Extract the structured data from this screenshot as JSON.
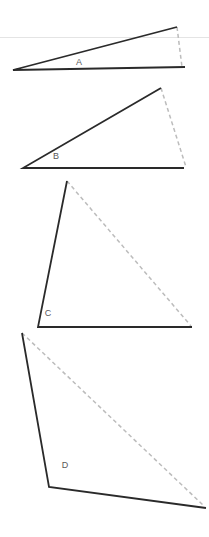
{
  "figure": {
    "background_color": "#ffffff",
    "width": 209,
    "height": 537,
    "solid_stroke_color": "#2a2a2a",
    "dashed_stroke_color": "#bcbcbc",
    "rule_color": "#e2e2e2",
    "label_color": "#5a5a5a",
    "solid_stroke_width": 1.8,
    "dashed_stroke_width": 1.5,
    "dash_pattern": "4 3"
  },
  "guides": [
    {
      "name": "top-horizontal-rule",
      "x1": 0,
      "y1": 37.5,
      "x2": 209,
      "y2": 37.5,
      "color": "#e4e4e4",
      "width": 1.2
    }
  ],
  "shapes": [
    {
      "id": "A",
      "label": "A",
      "label_x": 79,
      "label_y": 63,
      "vertex": {
        "x": 13,
        "y": 70
      },
      "ray_end": {
        "x": 177,
        "y": 27
      },
      "base_end": {
        "x": 185,
        "y": 67
      },
      "closing_start": {
        "x": 177,
        "y": 27
      },
      "closing_end": {
        "x": 182,
        "y": 67
      },
      "solid_path": "M 177 27 L 13 70 L 185 67",
      "dashed_path": "M 177 27 L 182 67"
    },
    {
      "id": "B",
      "label": "B",
      "label_x": 56,
      "label_y": 157,
      "vertex": {
        "x": 23,
        "y": 168
      },
      "ray_end": {
        "x": 161,
        "y": 88
      },
      "base_end": {
        "x": 184,
        "y": 168
      },
      "closing_start": {
        "x": 161,
        "y": 88
      },
      "closing_end": {
        "x": 186,
        "y": 167
      },
      "solid_path": "M 161 88 L 23 168 L 184 168",
      "dashed_path": "M 161 88 L 186 167"
    },
    {
      "id": "C",
      "label": "C",
      "label_x": 48,
      "label_y": 314,
      "vertex": {
        "x": 38,
        "y": 327
      },
      "ray_end": {
        "x": 67,
        "y": 181
      },
      "base_end": {
        "x": 192,
        "y": 327
      },
      "closing_start": {
        "x": 67,
        "y": 181
      },
      "closing_end": {
        "x": 191,
        "y": 326
      },
      "solid_path": "M 67 181 L 38 327 L 192 327",
      "dashed_path": "M 67 181 L 191 326"
    },
    {
      "id": "D",
      "label": "D",
      "label_x": 65,
      "label_y": 466,
      "vertex": {
        "x": 49,
        "y": 487
      },
      "ray_end": {
        "x": 22,
        "y": 333
      },
      "base_end": {
        "x": 206,
        "y": 508
      },
      "closing_start": {
        "x": 22,
        "y": 333
      },
      "closing_end": {
        "x": 204,
        "y": 506
      },
      "solid_path": "M 22 333 L 49 487 L 206 508",
      "dashed_path": "M 22 333 L 204 506"
    }
  ],
  "chart_data": {
    "type": "diagram",
    "categories": [
      "A",
      "B",
      "C",
      "D"
    ],
    "labels": [
      "A",
      "B",
      "C",
      "D"
    ],
    "series": [
      {
        "name": "approximate angle at vertex (degrees)",
        "values": [
          15,
          30,
          79,
          100
        ]
      }
    ],
    "annotations": [
      "A",
      "B",
      "C",
      "D"
    ],
    "legend": [],
    "grid": false,
    "xlabel": "",
    "ylabel": ""
  }
}
